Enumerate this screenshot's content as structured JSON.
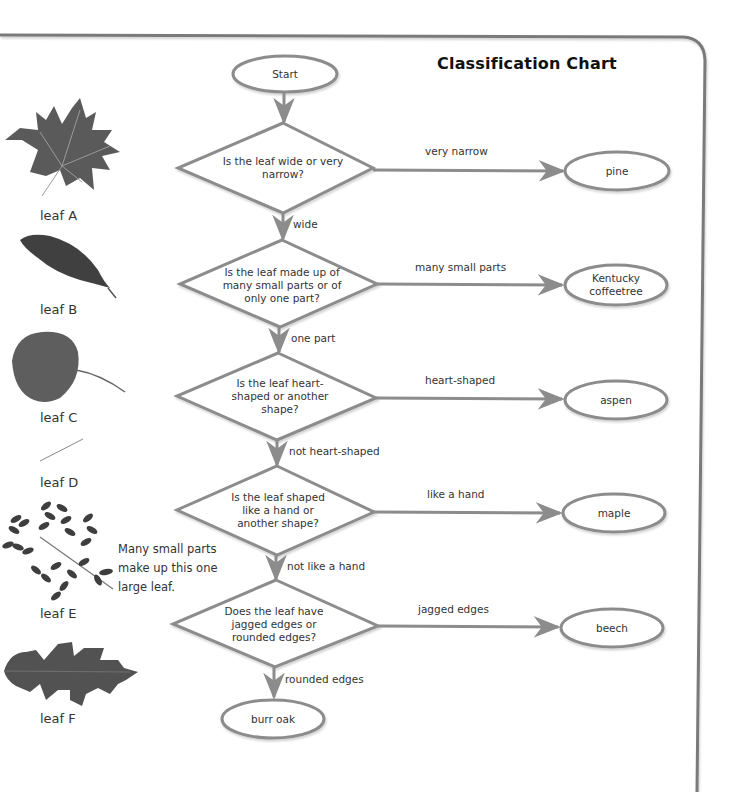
{
  "title": "Classification Chart",
  "colors": {
    "line": "#8c8c8c",
    "frame": "#7a7a7a",
    "leaf_dark": "#4a4a4a",
    "leaf_mid": "#6a6a6a"
  },
  "flowchart": {
    "start": "Start",
    "questions": [
      {
        "text": "Is the leaf wide or very narrow?",
        "yes_label": "very narrow",
        "yes_result": "pine",
        "next_label": "wide"
      },
      {
        "text": "Is the leaf made up of many small parts or of only one part?",
        "yes_label": "many small parts",
        "yes_result": "Kentucky coffeetree",
        "next_label": "one part"
      },
      {
        "text": "Is the leaf heart-shaped or another shape?",
        "yes_label": "heart-shaped",
        "yes_result": "aspen",
        "next_label": "not heart-shaped"
      },
      {
        "text": "Is the leaf shaped like a hand or another shape?",
        "yes_label": "like a hand",
        "yes_result": "maple",
        "next_label": "not like a hand"
      },
      {
        "text": "Does the leaf have jagged edges or rounded edges?",
        "yes_label": "jagged edges",
        "yes_result": "beech",
        "next_label": "rounded edges"
      }
    ],
    "final_result": "burr oak"
  },
  "leaves": [
    {
      "label": "leaf A",
      "icon": "maple-leaf-icon"
    },
    {
      "label": "leaf B",
      "icon": "beech-leaf-icon"
    },
    {
      "label": "leaf C",
      "icon": "aspen-leaf-icon"
    },
    {
      "label": "leaf D",
      "icon": "pine-needle-icon"
    },
    {
      "label": "leaf E",
      "icon": "compound-leaf-icon"
    },
    {
      "label": "leaf F",
      "icon": "oak-leaf-icon"
    }
  ],
  "note": {
    "lines": [
      "Many small parts",
      "make up this one",
      "large leaf."
    ]
  }
}
